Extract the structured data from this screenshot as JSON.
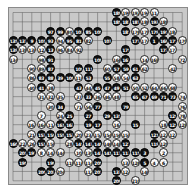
{
  "board": {
    "size": 19,
    "colors": {
      "board": "#c9c9c9",
      "line": "#5a5a5a",
      "black": "#111111",
      "white": "#fafafa"
    },
    "stones": [
      {
        "c": 11,
        "r": 0,
        "color": "b",
        "label": "189"
      },
      {
        "c": 12,
        "r": 0,
        "color": "w",
        "label": "190"
      },
      {
        "c": 13,
        "r": 0,
        "color": "w",
        "label": "192"
      },
      {
        "c": 14,
        "r": 0,
        "color": "w",
        "label": "194"
      },
      {
        "c": 15,
        "r": 0,
        "color": "w",
        "label": "11"
      },
      {
        "c": 11,
        "r": 1,
        "color": "b",
        "label": "185"
      },
      {
        "c": 12,
        "r": 1,
        "color": "b",
        "label": "183"
      },
      {
        "c": 13,
        "r": 1,
        "color": "b",
        "label": "187"
      },
      {
        "c": 14,
        "r": 1,
        "color": "w",
        "label": "186"
      },
      {
        "c": 15,
        "r": 1,
        "color": "b",
        "label": "193"
      },
      {
        "c": 16,
        "r": 1,
        "color": "w",
        "label": "188"
      },
      {
        "c": 4,
        "r": 2,
        "color": "b",
        "label": "97"
      },
      {
        "c": 5,
        "r": 2,
        "color": "b",
        "label": "99"
      },
      {
        "c": 6,
        "r": 2,
        "color": "w",
        "label": "80"
      },
      {
        "c": 7,
        "r": 2,
        "color": "b",
        "label": "103"
      },
      {
        "c": 8,
        "r": 2,
        "color": "b",
        "label": "85"
      },
      {
        "c": 9,
        "r": 2,
        "color": "b",
        "label": "105"
      },
      {
        "c": 12,
        "r": 2,
        "color": "b",
        "label": "181"
      },
      {
        "c": 13,
        "r": 2,
        "color": "w",
        "label": "176"
      },
      {
        "c": 14,
        "r": 2,
        "color": "w",
        "label": "178"
      },
      {
        "c": 15,
        "r": 2,
        "color": "b",
        "label": "179"
      },
      {
        "c": 16,
        "r": 2,
        "color": "b",
        "label": "191"
      },
      {
        "c": 17,
        "r": 2,
        "color": "w",
        "label": "184"
      },
      {
        "c": 0,
        "r": 3,
        "color": "b",
        "label": "135"
      },
      {
        "c": 1,
        "r": 3,
        "color": "b",
        "label": "137"
      },
      {
        "c": 2,
        "r": 3,
        "color": "b",
        "label": "9"
      },
      {
        "c": 3,
        "r": 3,
        "color": "b",
        "label": "101"
      },
      {
        "c": 4,
        "r": 3,
        "color": "b",
        "label": "93"
      },
      {
        "c": 5,
        "r": 3,
        "color": "w",
        "label": "94"
      },
      {
        "c": 6,
        "r": 3,
        "color": "b",
        "label": "95"
      },
      {
        "c": 7,
        "r": 3,
        "color": "b",
        "label": "81"
      },
      {
        "c": 8,
        "r": 3,
        "color": "w",
        "label": "82"
      },
      {
        "c": 10,
        "r": 3,
        "color": "b",
        "label": "107"
      },
      {
        "c": 13,
        "r": 3,
        "color": "b",
        "label": "177"
      },
      {
        "c": 14,
        "r": 3,
        "color": "w",
        "label": "174"
      },
      {
        "c": 15,
        "r": 3,
        "color": "b",
        "label": "1"
      },
      {
        "c": 16,
        "r": 3,
        "color": "b",
        "label": "169"
      },
      {
        "c": 17,
        "r": 3,
        "color": "b",
        "label": "171"
      },
      {
        "c": 18,
        "r": 3,
        "color": "w",
        "label": "170"
      },
      {
        "c": 0,
        "r": 4,
        "color": "b",
        "label": "139"
      },
      {
        "c": 1,
        "r": 4,
        "color": "w",
        "label": "138"
      },
      {
        "c": 2,
        "r": 4,
        "color": "w",
        "label": "136"
      },
      {
        "c": 3,
        "r": 4,
        "color": "w",
        "label": "12"
      },
      {
        "c": 4,
        "r": 4,
        "color": "b",
        "label": "13"
      },
      {
        "c": 5,
        "r": 4,
        "color": "w",
        "label": "96"
      },
      {
        "c": 6,
        "r": 4,
        "color": "w",
        "label": "84"
      },
      {
        "c": 7,
        "r": 4,
        "color": "w",
        "label": "92"
      },
      {
        "c": 12,
        "r": 4,
        "color": "b",
        "label": "175"
      },
      {
        "c": 16,
        "r": 4,
        "color": "b",
        "label": "173"
      },
      {
        "c": 17,
        "r": 4,
        "color": "w",
        "label": "172"
      },
      {
        "c": 0,
        "r": 5,
        "color": "w",
        "label": "134"
      },
      {
        "c": 3,
        "r": 5,
        "color": "w",
        "label": "98"
      },
      {
        "c": 4,
        "r": 5,
        "color": "b",
        "label": "91"
      },
      {
        "c": 9,
        "r": 5,
        "color": "b",
        "label": "108"
      },
      {
        "c": 11,
        "r": 5,
        "color": "w",
        "label": "166"
      },
      {
        "c": 12,
        "r": 5,
        "color": "b",
        "label": "167"
      },
      {
        "c": 14,
        "r": 5,
        "color": "w",
        "label": "14"
      },
      {
        "c": 15,
        "r": 5,
        "color": "w",
        "label": "168"
      },
      {
        "c": 18,
        "r": 5,
        "color": "w",
        "label": "72"
      },
      {
        "c": 2,
        "r": 6,
        "color": "w",
        "label": "90"
      },
      {
        "c": 3,
        "r": 6,
        "color": "w",
        "label": "89"
      },
      {
        "c": 4,
        "r": 6,
        "color": "b",
        "label": "87"
      },
      {
        "c": 7,
        "r": 6,
        "color": "b",
        "label": "109"
      },
      {
        "c": 8,
        "r": 6,
        "color": "b",
        "label": "111"
      },
      {
        "c": 10,
        "r": 6,
        "color": "w",
        "label": "60"
      },
      {
        "c": 11,
        "r": 6,
        "color": "b",
        "label": "57"
      },
      {
        "c": 12,
        "r": 6,
        "color": "b",
        "label": "59"
      },
      {
        "c": 13,
        "r": 6,
        "color": "b",
        "label": "61"
      },
      {
        "c": 14,
        "r": 6,
        "color": "w",
        "label": "62"
      },
      {
        "c": 17,
        "r": 6,
        "color": "w",
        "label": "42"
      },
      {
        "c": 2,
        "r": 7,
        "color": "w",
        "label": "86"
      },
      {
        "c": 3,
        "r": 7,
        "color": "b",
        "label": "83"
      },
      {
        "c": 4,
        "r": 7,
        "color": "b",
        "label": "88"
      },
      {
        "c": 5,
        "r": 7,
        "color": "b",
        "label": "39"
      },
      {
        "c": 6,
        "r": 7,
        "color": "b",
        "label": "100"
      },
      {
        "c": 7,
        "r": 7,
        "color": "w",
        "label": "110"
      },
      {
        "c": 8,
        "r": 7,
        "color": "b",
        "label": "53"
      },
      {
        "c": 10,
        "r": 7,
        "color": "b",
        "label": "55"
      },
      {
        "c": 11,
        "r": 7,
        "color": "w",
        "label": "58"
      },
      {
        "c": 12,
        "r": 7,
        "color": "w",
        "label": "54"
      },
      {
        "c": 13,
        "r": 7,
        "color": "b",
        "label": "63"
      },
      {
        "c": 2,
        "r": 8,
        "color": "w",
        "label": "40"
      },
      {
        "c": 3,
        "r": 8,
        "color": "b",
        "label": "41"
      },
      {
        "c": 4,
        "r": 8,
        "color": "w",
        "label": "38"
      },
      {
        "c": 7,
        "r": 8,
        "color": "b",
        "label": "43"
      },
      {
        "c": 8,
        "r": 8,
        "color": "w",
        "label": "44"
      },
      {
        "c": 9,
        "r": 8,
        "color": "b",
        "label": "45"
      },
      {
        "c": 10,
        "r": 8,
        "color": "b",
        "label": "47"
      },
      {
        "c": 11,
        "r": 8,
        "color": "b",
        "label": "49"
      },
      {
        "c": 12,
        "r": 8,
        "color": "b",
        "label": "51"
      },
      {
        "c": 13,
        "r": 8,
        "color": "w",
        "label": "50"
      },
      {
        "c": 14,
        "r": 8,
        "color": "w",
        "label": "52"
      },
      {
        "c": 15,
        "r": 8,
        "color": "w",
        "label": "64"
      },
      {
        "c": 16,
        "r": 8,
        "color": "w",
        "label": "66"
      },
      {
        "c": 17,
        "r": 8,
        "color": "w",
        "label": "68"
      },
      {
        "c": 3,
        "r": 9,
        "color": "w",
        "label": "31"
      },
      {
        "c": 4,
        "r": 9,
        "color": "w",
        "label": "32"
      },
      {
        "c": 5,
        "r": 9,
        "color": "w",
        "label": "35"
      },
      {
        "c": 7,
        "r": 9,
        "color": "w",
        "label": "37"
      },
      {
        "c": 8,
        "r": 9,
        "color": "b",
        "label": "33"
      },
      {
        "c": 9,
        "r": 9,
        "color": "w",
        "label": "36"
      },
      {
        "c": 10,
        "r": 9,
        "color": "w",
        "label": "46"
      },
      {
        "c": 11,
        "r": 9,
        "color": "w",
        "label": "48"
      },
      {
        "c": 13,
        "r": 9,
        "color": "b",
        "label": "65"
      },
      {
        "c": 14,
        "r": 9,
        "color": "b",
        "label": "67"
      },
      {
        "c": 15,
        "r": 9,
        "color": "b",
        "label": "69"
      },
      {
        "c": 16,
        "r": 9,
        "color": "b",
        "label": "71"
      },
      {
        "c": 17,
        "r": 9,
        "color": "b",
        "label": "73"
      },
      {
        "c": 18,
        "r": 9,
        "color": "w",
        "label": "74"
      },
      {
        "c": 4,
        "r": 10,
        "color": "w",
        "label": "30"
      },
      {
        "c": 5,
        "r": 10,
        "color": "b",
        "label": "34"
      },
      {
        "c": 7,
        "r": 10,
        "color": "w",
        "label": "71"
      },
      {
        "c": 8,
        "r": 10,
        "color": "w",
        "label": "56"
      },
      {
        "c": 9,
        "r": 10,
        "color": "b",
        "label": "77"
      },
      {
        "c": 12,
        "r": 10,
        "color": "b",
        "label": "79"
      },
      {
        "c": 18,
        "r": 10,
        "color": "w",
        "label": "76"
      },
      {
        "c": 3,
        "r": 11,
        "color": "w",
        "label": "7"
      },
      {
        "c": 5,
        "r": 11,
        "color": "w",
        "label": "24"
      },
      {
        "c": 6,
        "r": 11,
        "color": "b",
        "label": "25"
      },
      {
        "c": 8,
        "r": 11,
        "color": "b",
        "label": "27"
      },
      {
        "c": 10,
        "r": 11,
        "color": "b",
        "label": "29"
      },
      {
        "c": 11,
        "r": 11,
        "color": "b",
        "label": "131"
      },
      {
        "c": 17,
        "r": 11,
        "color": "b",
        "label": "129"
      },
      {
        "c": 18,
        "r": 11,
        "color": "w",
        "label": "78"
      },
      {
        "c": 2,
        "r": 12,
        "color": "w",
        "label": "162"
      },
      {
        "c": 3,
        "r": 12,
        "color": "w",
        "label": "164"
      },
      {
        "c": 4,
        "r": 12,
        "color": "w",
        "label": "11"
      },
      {
        "c": 5,
        "r": 12,
        "color": "b",
        "label": "161"
      },
      {
        "c": 6,
        "r": 12,
        "color": "b",
        "label": "163"
      },
      {
        "c": 8,
        "r": 12,
        "color": "b",
        "label": "19"
      },
      {
        "c": 9,
        "r": 12,
        "color": "b",
        "label": "17"
      },
      {
        "c": 11,
        "r": 12,
        "color": "w",
        "label": "16"
      },
      {
        "c": 13,
        "r": 12,
        "color": "b",
        "label": "15"
      },
      {
        "c": 16,
        "r": 12,
        "color": "w",
        "label": "18"
      },
      {
        "c": 17,
        "r": 12,
        "color": "b",
        "label": "125"
      },
      {
        "c": 18,
        "r": 12,
        "color": "w",
        "label": "128"
      },
      {
        "c": 2,
        "r": 13,
        "color": "w",
        "label": "21"
      },
      {
        "c": 3,
        "r": 13,
        "color": "b",
        "label": "157"
      },
      {
        "c": 4,
        "r": 13,
        "color": "b",
        "label": "159"
      },
      {
        "c": 5,
        "r": 13,
        "color": "b",
        "label": "155"
      },
      {
        "c": 6,
        "r": 13,
        "color": "b",
        "label": "153"
      },
      {
        "c": 7,
        "r": 13,
        "color": "w",
        "label": "20"
      },
      {
        "c": 8,
        "r": 13,
        "color": "w",
        "label": "23"
      },
      {
        "c": 9,
        "r": 13,
        "color": "w",
        "label": "152"
      },
      {
        "c": 10,
        "r": 13,
        "color": "w",
        "label": "154"
      },
      {
        "c": 11,
        "r": 13,
        "color": "w",
        "label": "156"
      },
      {
        "c": 12,
        "r": 13,
        "color": "w",
        "label": "158"
      },
      {
        "c": 15,
        "r": 13,
        "color": "b",
        "label": "121"
      },
      {
        "c": 16,
        "r": 13,
        "color": "w",
        "label": "122"
      },
      {
        "c": 17,
        "r": 13,
        "color": "w",
        "label": "123"
      },
      {
        "c": 0,
        "r": 14,
        "color": "b",
        "label": "160"
      },
      {
        "c": 1,
        "r": 14,
        "color": "w",
        "label": "22"
      },
      {
        "c": 2,
        "r": 14,
        "color": "w",
        "label": "26"
      },
      {
        "c": 3,
        "r": 14,
        "color": "b",
        "label": "151"
      },
      {
        "c": 4,
        "r": 14,
        "color": "w",
        "label": "150"
      },
      {
        "c": 6,
        "r": 14,
        "color": "w",
        "label": "28"
      },
      {
        "c": 7,
        "r": 14,
        "color": "b",
        "label": "145"
      },
      {
        "c": 8,
        "r": 14,
        "color": "b",
        "label": "147"
      },
      {
        "c": 9,
        "r": 14,
        "color": "b",
        "label": "149"
      },
      {
        "c": 10,
        "r": 14,
        "color": "w",
        "label": "146"
      },
      {
        "c": 11,
        "r": 14,
        "color": "w",
        "label": "148"
      },
      {
        "c": 12,
        "r": 14,
        "color": "b",
        "label": "127"
      },
      {
        "c": 15,
        "r": 14,
        "color": "b",
        "label": "119"
      },
      {
        "c": 16,
        "r": 14,
        "color": "w",
        "label": "120"
      },
      {
        "c": 1,
        "r": 15,
        "color": "b",
        "label": "201"
      },
      {
        "c": 2,
        "r": 15,
        "color": "b",
        "label": "197"
      },
      {
        "c": 3,
        "r": 15,
        "color": "w",
        "label": "8"
      },
      {
        "c": 4,
        "r": 15,
        "color": "w",
        "label": "142"
      },
      {
        "c": 5,
        "r": 15,
        "color": "w",
        "label": "144"
      },
      {
        "c": 7,
        "r": 15,
        "color": "w",
        "label": "10"
      },
      {
        "c": 8,
        "r": 15,
        "color": "w",
        "label": "130"
      },
      {
        "c": 9,
        "r": 15,
        "color": "b",
        "label": "143"
      },
      {
        "c": 10,
        "r": 15,
        "color": "b",
        "label": "141"
      },
      {
        "c": 11,
        "r": 15,
        "color": "b",
        "label": "117"
      },
      {
        "c": 12,
        "r": 15,
        "color": "b",
        "label": "113"
      },
      {
        "c": 13,
        "r": 15,
        "color": "b",
        "label": "115"
      },
      {
        "c": 14,
        "r": 15,
        "color": "b",
        "label": "3"
      },
      {
        "c": 16,
        "r": 15,
        "color": "w",
        "label": "2"
      },
      {
        "c": 1,
        "r": 16,
        "color": "b",
        "label": "195"
      },
      {
        "c": 4,
        "r": 16,
        "color": "b",
        "label": "199"
      },
      {
        "c": 6,
        "r": 16,
        "color": "w",
        "label": "118"
      },
      {
        "c": 7,
        "r": 16,
        "color": "w",
        "label": "116"
      },
      {
        "c": 8,
        "r": 16,
        "color": "w",
        "label": "114"
      },
      {
        "c": 9,
        "r": 16,
        "color": "b",
        "label": "205"
      },
      {
        "c": 12,
        "r": 16,
        "color": "w",
        "label": "132"
      },
      {
        "c": 13,
        "r": 16,
        "color": "w",
        "label": "126"
      },
      {
        "c": 14,
        "r": 16,
        "color": "b",
        "label": "5"
      },
      {
        "c": 15,
        "r": 16,
        "color": "w",
        "label": "4"
      },
      {
        "c": 16,
        "r": 16,
        "color": "w",
        "label": "6"
      },
      {
        "c": 3,
        "r": 17,
        "color": "b",
        "label": "200"
      },
      {
        "c": 4,
        "r": 17,
        "color": "b",
        "label": "203"
      },
      {
        "c": 5,
        "r": 17,
        "color": "w",
        "label": "204"
      },
      {
        "c": 8,
        "r": 17,
        "color": "w",
        "label": "112"
      },
      {
        "c": 9,
        "r": 17,
        "color": "b",
        "label": "207"
      },
      {
        "c": 11,
        "r": 17,
        "color": "b",
        "label": "133"
      },
      {
        "c": 12,
        "r": 17,
        "color": "w",
        "label": "124"
      },
      {
        "c": 14,
        "r": 17,
        "color": "w",
        "label": "140"
      },
      {
        "c": 11,
        "r": 18,
        "color": "b",
        "label": "209"
      },
      {
        "c": 13,
        "r": 18,
        "color": "w",
        "label": "210"
      }
    ]
  }
}
